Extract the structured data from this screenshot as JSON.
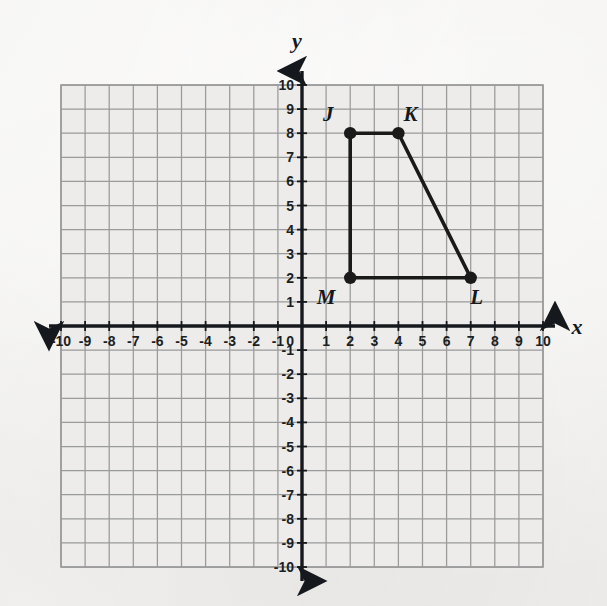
{
  "figure": {
    "background_color": "#f2f1ef",
    "grid_color": "#9a9a9a",
    "axis_color": "#15181c",
    "shape_color": "#1a1a1a"
  },
  "axes": {
    "x_label": "x",
    "y_label": "y",
    "x_min": -10,
    "x_max": 10,
    "y_min": -10,
    "y_max": 10,
    "origin_label": "0",
    "x_tick_labels": [
      "-10",
      "-9",
      "-8",
      "-7",
      "-6",
      "-5",
      "-4",
      "-3",
      "-2",
      "-1",
      "1",
      "2",
      "3",
      "4",
      "5",
      "6",
      "7",
      "8",
      "9",
      "10"
    ],
    "y_tick_labels": [
      "10",
      "9",
      "8",
      "7",
      "6",
      "5",
      "4",
      "3",
      "2",
      "1",
      "-1",
      "-2",
      "-3",
      "-4",
      "-5",
      "-6",
      "-7",
      "-8",
      "-9",
      "-10"
    ]
  },
  "chart_data": {
    "type": "scatter",
    "xlabel": "x",
    "ylabel": "y",
    "xlim": [
      -10,
      10
    ],
    "ylim": [
      -10,
      10
    ],
    "grid": true,
    "legend": "none",
    "points": [
      {
        "label": "J",
        "x": 2,
        "y": 8,
        "label_dx": -22,
        "label_dy": -12
      },
      {
        "label": "K",
        "x": 4,
        "y": 8,
        "label_dx": 12,
        "label_dy": -12
      },
      {
        "label": "L",
        "x": 7,
        "y": 2,
        "label_dx": 6,
        "label_dy": 26
      },
      {
        "label": "M",
        "x": 2,
        "y": 2,
        "label_dx": -24,
        "label_dy": 26
      }
    ],
    "polygon_order": [
      "J",
      "K",
      "L",
      "M"
    ],
    "closed": true
  },
  "vertex_labels": {
    "j": "J",
    "k": "K",
    "l": "L",
    "m": "M"
  }
}
